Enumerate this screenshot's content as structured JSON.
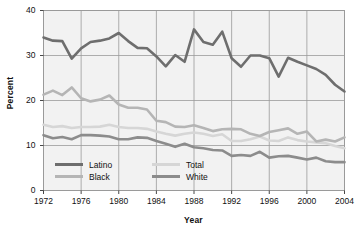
{
  "chart_data": {
    "type": "line",
    "title": "",
    "xlabel": "Year",
    "ylabel": "Percent",
    "xlim": [
      1972,
      2004
    ],
    "ylim": [
      0,
      40
    ],
    "grid": true,
    "legend_position": "inside-bottom-left",
    "xticks": [
      1972,
      1976,
      1980,
      1984,
      1988,
      1992,
      1996,
      2000,
      2004
    ],
    "yticks": [
      0,
      10,
      20,
      30,
      40
    ],
    "x": [
      1972,
      1973,
      1974,
      1975,
      1976,
      1977,
      1978,
      1979,
      1980,
      1981,
      1982,
      1983,
      1984,
      1985,
      1986,
      1987,
      1988,
      1989,
      1990,
      1991,
      1992,
      1993,
      1994,
      1995,
      1996,
      1997,
      1998,
      1999,
      2000,
      2001,
      2002,
      2003,
      2004
    ],
    "series": [
      {
        "name": "Latino",
        "color": "#6e6e6e",
        "width": 2.6,
        "values": [
          34.0,
          33.3,
          33.2,
          29.3,
          31.6,
          33.0,
          33.3,
          33.8,
          35.0,
          33.2,
          31.7,
          31.6,
          29.8,
          27.6,
          30.1,
          28.6,
          35.8,
          33.0,
          32.4,
          35.3,
          29.4,
          27.5,
          30.0,
          30.0,
          29.4,
          25.3,
          29.5,
          28.6,
          27.8,
          27.0,
          25.7,
          23.5,
          22.0
        ]
      },
      {
        "name": "Black",
        "color": "#b5b5b5",
        "width": 2.6,
        "values": [
          21.3,
          22.2,
          21.2,
          22.9,
          20.5,
          19.8,
          20.2,
          21.1,
          19.1,
          18.4,
          18.4,
          18.0,
          15.5,
          15.2,
          14.2,
          14.1,
          14.5,
          13.9,
          13.2,
          13.6,
          13.7,
          13.6,
          12.6,
          12.1,
          13.0,
          13.4,
          13.8,
          12.6,
          13.1,
          10.9,
          11.3,
          10.9,
          11.8
        ]
      },
      {
        "name": "Total",
        "color": "#d6d6d6",
        "width": 2.6,
        "values": [
          14.6,
          14.1,
          14.3,
          13.9,
          14.1,
          14.1,
          14.2,
          14.6,
          14.1,
          13.9,
          13.9,
          13.7,
          13.1,
          12.6,
          12.2,
          12.6,
          12.9,
          12.6,
          12.1,
          12.5,
          11.0,
          11.0,
          11.4,
          12.0,
          11.1,
          11.0,
          11.8,
          11.2,
          10.9,
          10.7,
          10.5,
          9.9,
          9.4
        ]
      },
      {
        "name": "White",
        "color": "#8c8c8c",
        "width": 2.6,
        "values": [
          12.3,
          11.6,
          11.9,
          11.4,
          12.3,
          12.3,
          12.2,
          12.0,
          11.4,
          11.4,
          11.8,
          11.7,
          11.0,
          10.4,
          9.7,
          10.4,
          9.6,
          9.4,
          9.0,
          8.9,
          7.7,
          7.9,
          7.7,
          8.6,
          7.3,
          7.6,
          7.7,
          7.3,
          6.9,
          7.3,
          6.5,
          6.3,
          6.3
        ]
      }
    ]
  },
  "legend": {
    "entries": [
      {
        "label": "Latino",
        "color": "#6e6e6e"
      },
      {
        "label": "Black",
        "color": "#b5b5b5"
      },
      {
        "label": "Total",
        "color": "#d6d6d6"
      },
      {
        "label": "White",
        "color": "#8c8c8c"
      }
    ]
  },
  "style": {
    "plot_background": "#f2f2f2",
    "grid_color": "#9a9a9a",
    "frame_color": "#9a9a9a",
    "text_color": "#111111",
    "page_background": "#ffffff"
  }
}
